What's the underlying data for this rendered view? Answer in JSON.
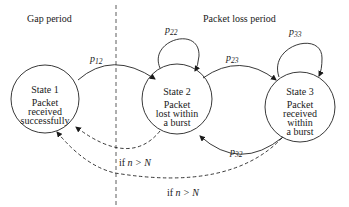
{
  "diagram": {
    "type": "state-transition",
    "regions": {
      "left": "Gap period",
      "right": "Packet loss period"
    },
    "states": [
      {
        "id": "s1",
        "title": "State 1",
        "lines": [
          "Packet",
          "received",
          "successfully"
        ]
      },
      {
        "id": "s2",
        "title": "State 2",
        "lines": [
          "Packet",
          "lost within",
          "a burst"
        ]
      },
      {
        "id": "s3",
        "title": "State 3",
        "lines": [
          "Packet",
          "received",
          "within",
          "a burst"
        ]
      }
    ],
    "transitions": [
      {
        "from": "s1",
        "to": "s2",
        "label_base": "p",
        "label_sub": "12",
        "style": "solid"
      },
      {
        "from": "s2",
        "to": "s2",
        "label_base": "p",
        "label_sub": "22",
        "style": "solid"
      },
      {
        "from": "s2",
        "to": "s3",
        "label_base": "p",
        "label_sub": "23",
        "style": "solid"
      },
      {
        "from": "s3",
        "to": "s3",
        "label_base": "p",
        "label_sub": "33",
        "style": "solid"
      },
      {
        "from": "s3",
        "to": "s2",
        "label_base": "p",
        "label_sub": "32",
        "style": "solid"
      },
      {
        "from": "s2",
        "to": "s1",
        "label_prefix": "if ",
        "label_math": "n > N",
        "style": "dashed"
      },
      {
        "from": "s3",
        "to": "s1",
        "label_prefix": "if ",
        "label_math": "n > N",
        "style": "dashed"
      }
    ]
  }
}
